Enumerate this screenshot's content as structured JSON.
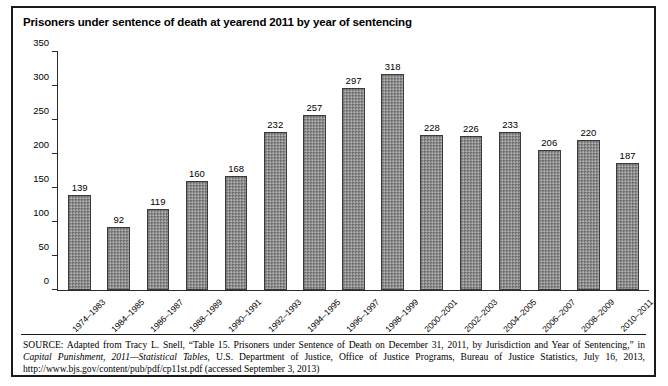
{
  "figure": {
    "title": "Prisoners under sentence of death at yearend 2011 by year of sentencing"
  },
  "chart_data": {
    "type": "bar",
    "title": "Prisoners under sentence of death at yearend 2011 by year of sentencing",
    "xlabel": "",
    "ylabel": "",
    "ylim": [
      0,
      350
    ],
    "yticks": [
      0,
      50,
      100,
      150,
      200,
      250,
      300,
      350
    ],
    "grid": false,
    "legend": "none",
    "bar_color": "#8e8e8e",
    "bar_border_color": "#3b3b3b",
    "categories": [
      "1974–1983",
      "1984–1985",
      "1986–1987",
      "1988–1989",
      "1990–1991",
      "1992–1993",
      "1994–1995",
      "1996–1997",
      "1998–1999",
      "2000–2001",
      "2002–2003",
      "2004–2005",
      "2006–2007",
      "2008–2009",
      "2010–2011"
    ],
    "values": [
      139,
      92,
      119,
      160,
      168,
      232,
      257,
      297,
      318,
      228,
      226,
      233,
      206,
      220,
      187
    ],
    "data_labels": [
      "139",
      "92",
      "119",
      "160",
      "168",
      "232",
      "257",
      "297",
      "318",
      "228",
      "226",
      "233",
      "206",
      "220",
      "187"
    ],
    "ytick_labels": [
      "0",
      "50",
      "100",
      "150",
      "200",
      "250",
      "300",
      "350"
    ]
  },
  "source": {
    "keyword": "SOURCE:",
    "text_part1": " Adapted from Tracy L. Snell, “Table 15. Prisoners under Sentence of Death on December 31, 2011, by Jurisdiction and Year of Sentencing,” in ",
    "italic_title": "Capital Punishment, 2011—Statistical Tables",
    "text_part2": ", U.S. Department of Justice, Office of Justice Programs, Bureau of Justice Statistics, July 16, 2013, http://www.bjs.gov/content/pub/pdf/cp11st.pdf (accessed September 3, 2013)"
  }
}
